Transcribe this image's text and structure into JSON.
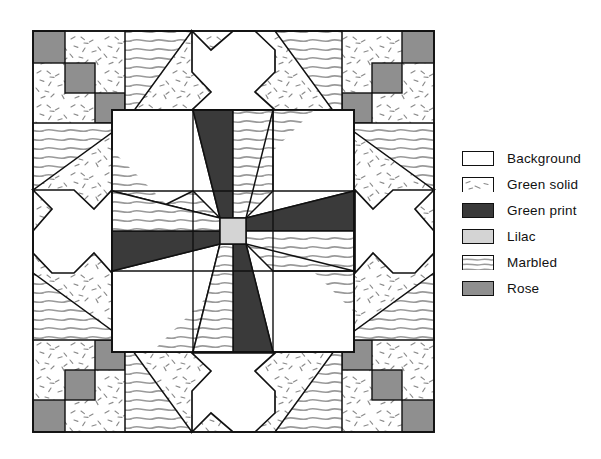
{
  "diagram": {
    "type": "quilt-block",
    "block_label": "Eight-pointed star quilt block with pieced border"
  },
  "fabrics": {
    "background": {
      "key": "background",
      "label": "Background",
      "color": "#ffffff",
      "pattern": "solid-white"
    },
    "green_solid": {
      "key": "green_solid",
      "label": "Green solid",
      "color": "#fbfbfb",
      "pattern": "speckle-dashes"
    },
    "green_print": {
      "key": "green_print",
      "label": "Green print",
      "color": "#3a3a3a",
      "pattern": "solid-dark"
    },
    "lilac": {
      "key": "lilac",
      "label": "Lilac",
      "color": "#d4d4d4",
      "pattern": "solid-light-gray"
    },
    "marbled": {
      "key": "marbled",
      "label": "Marbled",
      "color": "#ffffff",
      "pattern": "wavy-horizontal-lines"
    },
    "rose": {
      "key": "rose",
      "label": "Rose",
      "color": "#8f8f8f",
      "pattern": "solid-mid-gray"
    }
  },
  "legend": {
    "position": "right",
    "items": [
      {
        "label": "Background",
        "swatch": "background",
        "icon": "swatch-background-icon"
      },
      {
        "label": "Green solid",
        "swatch": "green_solid",
        "icon": "swatch-green-solid-icon"
      },
      {
        "label": "Green print",
        "swatch": "green_print",
        "icon": "swatch-green-print-icon"
      },
      {
        "label": "Lilac",
        "swatch": "lilac",
        "icon": "swatch-lilac-icon"
      },
      {
        "label": "Marbled",
        "swatch": "marbled",
        "icon": "swatch-marbled-icon"
      },
      {
        "label": "Rose",
        "swatch": "rose",
        "icon": "swatch-rose-icon"
      }
    ]
  },
  "layout": {
    "frame": {
      "x": 33,
      "y": 31,
      "size": 401,
      "stroke": "#111111"
    },
    "center_grid": {
      "x": 112,
      "y": 110,
      "size": 242,
      "cells": 3,
      "cell_size": 80.67
    },
    "center_square": {
      "size": 26,
      "fabric": "lilac"
    },
    "star_points": 8,
    "star_point_fabrics": [
      "green_print",
      "marbled"
    ],
    "corner_rose_steps": 3,
    "edge_crosses": 4,
    "corner_crosses": 4
  }
}
